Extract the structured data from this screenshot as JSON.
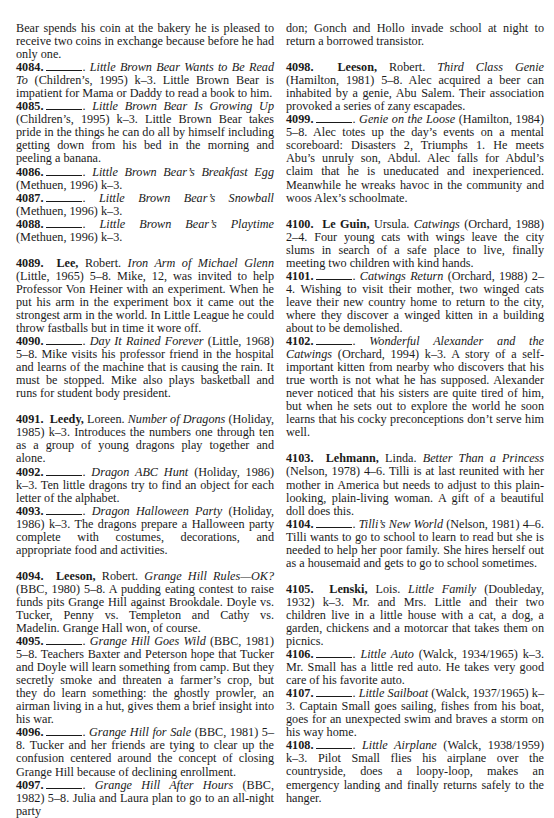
{
  "columns": [
    {
      "entries": [
        {
          "continuation": true,
          "text": "Bear spends his coin at the bakery he is pleased to receive two coins in exchange because before he had only one."
        },
        {
          "number": "4084.",
          "author": "",
          "given": "",
          "title": "Little Brown Bear Wants to Be Read To",
          "pub": "(Children’s, 1995) k–3.",
          "text": "Little Brown Bear is impatient for Mama or Daddy to read a book to him."
        },
        {
          "number": "4085.",
          "author": "",
          "given": "",
          "title": "Little Brown Bear Is Growing Up",
          "pub": "(Children’s, 1995) k–3.",
          "text": "Little Brown Bear takes pride in the things he can do all by himself including getting down from his bed in the morning and peeling a banana."
        },
        {
          "number": "4086.",
          "author": "",
          "given": "",
          "title": "Little Brown Bear’s Breakfast Egg",
          "pub": "(Methuen, 1996) k–3.",
          "text": ""
        },
        {
          "number": "4087.",
          "author": "",
          "given": "",
          "title": "Little Brown Bear’s Snowball",
          "pub": "(Methuen, 1996) k–3.",
          "text": ""
        },
        {
          "number": "4088.",
          "author": "",
          "given": "",
          "title": "Little Brown Bear’s Playtime",
          "pub": "(Methuen, 1996) k–3.",
          "text": ""
        },
        {
          "number": "4089.",
          "author": "Lee,",
          "given": "Robert.",
          "title": "Iron Arm of Michael Glenn",
          "pub": "(Little, 1965) 5–8.",
          "text": "Mike, 12, was invited to help Professor Von Heiner with an experiment. When he put his arm in the experiment box it came out the strongest arm in the world. In Little League he could throw fastballs but in time it wore off.",
          "group_start": true
        },
        {
          "number": "4090.",
          "author": "",
          "given": "",
          "title": "Day It Rained Forever",
          "pub": "(Little, 1968) 5–8.",
          "text": "Mike visits his professor friend in the hospital and learns of the machine that is causing the rain. It must be stopped. Mike also plays basketball and runs for student body president."
        },
        {
          "number": "4091.",
          "author": "Leedy,",
          "given": "Loreen.",
          "title": "Number of Dragons",
          "pub": "(Holiday, 1985) k–3.",
          "text": "Introduces the numbers one through ten as a group of young dragons play together and alone.",
          "group_start": true
        },
        {
          "number": "4092.",
          "author": "",
          "given": "",
          "title": "Dragon ABC Hunt",
          "pub": "(Holiday, 1986) k–3.",
          "text": "Ten little dragons try to find an object for each letter of the alphabet."
        },
        {
          "number": "4093.",
          "author": "",
          "given": "",
          "title": "Dragon Halloween Party",
          "pub": "(Holiday, 1986) k–3.",
          "text": "The dragons prepare a Halloween party complete with costumes, decorations, and appropriate food and activities."
        },
        {
          "number": "4094.",
          "author": "Leeson,",
          "given": "Robert.",
          "title": "Grange Hill Rules—OK?",
          "pub": "(BBC, 1980) 5–8.",
          "text": "A pudding eating contest to raise funds pits Grange Hill against Brookdale. Doyle vs. Tucker, Penny vs. Templeton and Cathy vs. Madelin. Grange Hall won, of course.",
          "group_start": true
        },
        {
          "number": "4095.",
          "author": "",
          "given": "",
          "title": "Grange Hill Goes Wild",
          "pub": "(BBC, 1981) 5–8.",
          "text": "Teachers Baxter and Peterson hope that Tucker and Doyle will learn something from camp. But they secretly smoke and threaten a farmer’s crop, but they do learn something: the ghostly prowler, an airman living in a hut, gives them a brief insight into his war."
        },
        {
          "number": "4096.",
          "author": "",
          "given": "",
          "title": "Grange Hill for Sale",
          "pub": "(BBC, 1981) 5–8.",
          "text": "Tucker and her friends are tying to clear up the confusion centered around the concept of closing Grange Hill because of declining enrollment."
        },
        {
          "number": "4097.",
          "author": "",
          "given": "",
          "title": "Grange Hill After Hours",
          "pub": "(BBC, 1982) 5–8.",
          "text": "Julia and Laura plan to go to an all-night party"
        }
      ]
    },
    {
      "entries": [
        {
          "continuation": true,
          "text": "don; Gonch and Hollo invade school at night to return a borrowed transistor."
        },
        {
          "number": "4098.",
          "author": "Leeson,",
          "given": "Robert.",
          "title": "Third Class Genie",
          "pub": "(Hamilton, 1981) 5–8.",
          "text": "Alec acquired a beer can inhabited by a genie, Abu Salem. Their association provoked a series of zany escapades.",
          "group_start": true
        },
        {
          "number": "4099.",
          "author": "",
          "given": "",
          "title": "Genie on the Loose",
          "pub": "(Hamilton, 1984) 5–8.",
          "text": "Alec totes up the day’s events on a mental scoreboard: Disasters 2, Triumphs 1. He meets Abu’s unruly son, Abdul. Alec falls for Abdul’s claim that he is uneducated and inexperienced. Meanwhile he wreaks havoc in the community and woos Alex’s schoolmate."
        },
        {
          "number": "4100.",
          "author": "Le Guin,",
          "given": "Ursula.",
          "title": "Catwings",
          "pub": "(Orchard, 1988) 2–4.",
          "text": "Four young cats with wings leave the city slums in search of a safe place to live, finally meeting two children with kind hands.",
          "group_start": true
        },
        {
          "number": "4101.",
          "author": "",
          "given": "",
          "title": "Catwings Return",
          "pub": "(Orchard, 1988) 2–4.",
          "text": "Wishing to visit their mother, two winged cats leave their new country home to return to the city, where they discover a winged kitten in a building about to be demolished."
        },
        {
          "number": "4102.",
          "author": "",
          "given": "",
          "title": "Wonderful Alexander and the Catwings",
          "pub": "(Orchard, 1994) k–3.",
          "text": "A story of a self-important kitten from nearby who discovers that his true worth is not what he has supposed. Alexander never noticed that his sisters are quite tired of him, but when he sets out to explore the world he soon learns that his cocky preconceptions don’t serve him well."
        },
        {
          "number": "4103.",
          "author": "Lehmann,",
          "given": "Linda.",
          "title": "Better Than a Princess",
          "pub": "(Nelson, 1978) 4–6.",
          "text": "Tilli is at last reunited with her mother in America but needs to adjust to this plain-looking, plain-living woman. A gift of a beautiful doll does this.",
          "group_start": true
        },
        {
          "number": "4104.",
          "author": "",
          "given": "",
          "title": "Tilli’s New World",
          "pub": "(Nelson, 1981) 4–6.",
          "text": "Tilli wants to go to school to learn to read but she is needed to help her poor family. She hires herself out as a housemaid and gets to go to school sometimes."
        },
        {
          "number": "4105.",
          "author": "Lenski,",
          "given": "Lois.",
          "title": "Little Family",
          "pub": "(Doubleday, 1932) k–3.",
          "text": "Mr. and Mrs. Little and their two children live in a little house with a cat, a dog, a garden, chickens and a motorcar that takes them on picnics.",
          "group_start": true
        },
        {
          "number": "4106.",
          "author": "",
          "given": "",
          "title": "Little Auto",
          "pub": "(Walck, 1934/1965) k–3.",
          "text": "Mr. Small has a little red auto. He takes very good care of his favorite auto."
        },
        {
          "number": "4107.",
          "author": "",
          "given": "",
          "title": "Little Sailboat",
          "pub": "(Walck, 1937/1965) k–3.",
          "text": "Captain Small goes sailing, fishes from his boat, goes for an unexpected swim and braves a storm on his way home."
        },
        {
          "number": "4108.",
          "author": "",
          "given": "",
          "title": "Little Airplane",
          "pub": "(Walck, 1938/1959) k–3.",
          "text": "Pilot Small flies his airplane over the countryside, does a loopy-loop, makes an emergency landing and finally returns safely to the hanger."
        }
      ]
    }
  ]
}
